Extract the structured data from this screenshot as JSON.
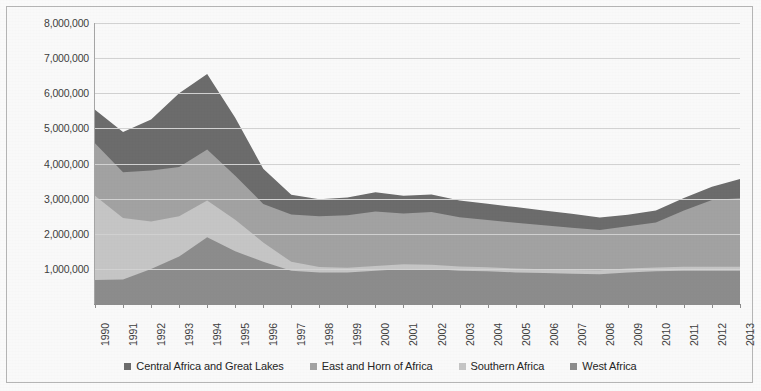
{
  "chart_data": {
    "type": "area",
    "stacked": true,
    "title": "",
    "subtitle": "",
    "xlabel": "",
    "ylabel": "",
    "grid": true,
    "legend_position": "bottom",
    "ylim": [
      0,
      8000000
    ],
    "ytick_labels": [
      "8,000,000",
      "7,000,000",
      "6,000,000",
      "5,000,000",
      "4,000,000",
      "3,000,000",
      "2,000,000",
      "1,000,000"
    ],
    "ytick_values": [
      8000000,
      7000000,
      6000000,
      5000000,
      4000000,
      3000000,
      2000000,
      1000000
    ],
    "categories": [
      "1990",
      "1991",
      "1992",
      "1993",
      "1994",
      "1995",
      "1996",
      "1997",
      "1998",
      "1999",
      "2000",
      "2001",
      "2002",
      "2003",
      "2004",
      "2005",
      "2006",
      "2007",
      "2008",
      "2009",
      "2010",
      "2011",
      "2012",
      "2013"
    ],
    "x": [
      1990,
      1991,
      1992,
      1993,
      1994,
      1995,
      1996,
      1997,
      1998,
      1999,
      2000,
      2001,
      2002,
      2003,
      2004,
      2005,
      2006,
      2007,
      2008,
      2009,
      2010,
      2011,
      2012,
      2013
    ],
    "series": [
      {
        "name": "West Africa",
        "color": "#8f8f8f",
        "stack_order": 1,
        "values": [
          680000,
          700000,
          1000000,
          1350000,
          1900000,
          1500000,
          1200000,
          950000,
          900000,
          900000,
          950000,
          1000000,
          1000000,
          950000,
          930000,
          900000,
          880000,
          860000,
          850000,
          900000,
          930000,
          950000,
          950000,
          950000
        ]
      },
      {
        "name": "Southern Africa",
        "color": "#c9c9c9",
        "stack_order": 2,
        "values": [
          2400000,
          1750000,
          1350000,
          1150000,
          1050000,
          900000,
          550000,
          250000,
          150000,
          130000,
          130000,
          130000,
          120000,
          120000,
          115000,
          110000,
          110000,
          110000,
          110000,
          110000,
          110000,
          110000,
          110000,
          110000
        ]
      },
      {
        "name": "East and Horn of Africa",
        "color": "#a5a5a5",
        "stack_order": 3,
        "values": [
          1500000,
          1300000,
          1450000,
          1400000,
          1450000,
          1250000,
          1100000,
          1350000,
          1450000,
          1500000,
          1550000,
          1450000,
          1500000,
          1400000,
          1350000,
          1300000,
          1250000,
          1200000,
          1150000,
          1200000,
          1280000,
          1600000,
          1900000,
          1950000
        ]
      },
      {
        "name": "Central Africa and Great Lakes",
        "color": "#6e6e6e",
        "stack_order": 4,
        "values": [
          950000,
          1150000,
          1450000,
          2100000,
          2150000,
          1650000,
          1000000,
          560000,
          480000,
          500000,
          550000,
          500000,
          500000,
          480000,
          460000,
          450000,
          420000,
          400000,
          350000,
          330000,
          340000,
          360000,
          380000,
          550000
        ]
      }
    ],
    "totals": [
      5530000,
      4900000,
      5250000,
      6000000,
      6550000,
      5300000,
      3850000,
      3110000,
      2980000,
      3030000,
      3180000,
      3080000,
      3120000,
      2950000,
      2855000,
      2760000,
      2660000,
      2570000,
      2460000,
      2540000,
      2660000,
      3020000,
      3340000,
      3560000
    ]
  },
  "legend": {
    "items": [
      {
        "label": "Central Africa and Great Lakes",
        "color": "#6e6e6e"
      },
      {
        "label": "East and Horn of Africa",
        "color": "#a5a5a5"
      },
      {
        "label": "Southern Africa",
        "color": "#c9c9c9"
      },
      {
        "label": "West Africa",
        "color": "#8f8f8f"
      }
    ]
  }
}
